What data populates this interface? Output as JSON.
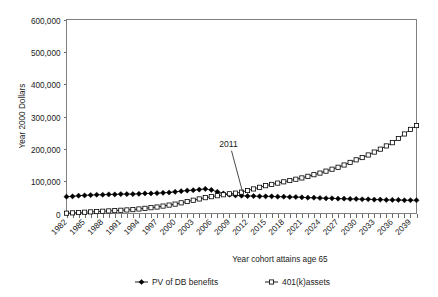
{
  "chart_data": {
    "type": "line",
    "title": "",
    "subtitle": "",
    "xlabel": "Year cohort attains age 65",
    "ylabel": "Year 2000 Dollars",
    "xlim": [
      1982,
      2040
    ],
    "ylim": [
      0,
      600000
    ],
    "ytick_labels": [
      "600,000",
      "500,000",
      "400,000",
      "300,000",
      "200,000",
      "100,000",
      "0"
    ],
    "ytick_values": [
      600000,
      500000,
      400000,
      300000,
      200000,
      100000,
      0
    ],
    "xtick_labels": [
      "1982",
      "1985",
      "1988",
      "1991",
      "1994",
      "1997",
      "2000",
      "2003",
      "2006",
      "2009",
      "2012",
      "2015",
      "2018",
      "2021",
      "2024",
      "2027",
      "2030",
      "2033",
      "2036",
      "2039"
    ],
    "xtick_values": [
      1982,
      1985,
      1988,
      1991,
      1994,
      1997,
      2000,
      2003,
      2006,
      2009,
      2012,
      2015,
      2018,
      2021,
      2024,
      2027,
      2030,
      2033,
      2036,
      2039
    ],
    "grid": false,
    "legend_position": "bottom",
    "x": [
      1982,
      1983,
      1984,
      1985,
      1986,
      1987,
      1988,
      1989,
      1990,
      1991,
      1992,
      1993,
      1994,
      1995,
      1996,
      1997,
      1998,
      1999,
      2000,
      2001,
      2002,
      2003,
      2004,
      2005,
      2006,
      2007,
      2008,
      2009,
      2010,
      2011,
      2012,
      2013,
      2014,
      2015,
      2016,
      2017,
      2018,
      2019,
      2020,
      2021,
      2022,
      2023,
      2024,
      2025,
      2026,
      2027,
      2028,
      2029,
      2030,
      2031,
      2032,
      2033,
      2034,
      2035,
      2036,
      2037,
      2038,
      2039,
      2040
    ],
    "series": [
      {
        "name": "PV of DB benefits",
        "marker": "filled-diamond",
        "values": [
          52000,
          53000,
          55000,
          56000,
          57000,
          58000,
          58000,
          59000,
          59000,
          60000,
          60000,
          60000,
          61000,
          62000,
          62000,
          63000,
          64000,
          65000,
          67000,
          69000,
          71000,
          72000,
          74000,
          76000,
          73000,
          67000,
          62000,
          58000,
          56000,
          55000,
          54000,
          54000,
          53000,
          53000,
          53000,
          52000,
          52000,
          51000,
          51000,
          50000,
          49000,
          49000,
          48000,
          47000,
          47000,
          46000,
          46000,
          45000,
          45000,
          44000,
          44000,
          43000,
          43000,
          42000,
          42000,
          42000,
          41000,
          41000,
          41000
        ]
      },
      {
        "name": "401(k)assets",
        "marker": "open-square",
        "values": [
          1000,
          2000,
          3000,
          4000,
          5000,
          6000,
          7000,
          8000,
          9000,
          10000,
          11000,
          12000,
          14000,
          16000,
          18000,
          20000,
          23000,
          26000,
          29000,
          33000,
          37000,
          41000,
          45000,
          49000,
          52000,
          55000,
          58000,
          61000,
          63000,
          66000,
          71000,
          76000,
          81000,
          86000,
          90000,
          94000,
          98000,
          102000,
          106000,
          110000,
          115000,
          120000,
          125000,
          131000,
          137000,
          143000,
          150000,
          158000,
          166000,
          173000,
          181000,
          190000,
          199000,
          209000,
          219000,
          232000,
          246000,
          260000,
          272000
        ]
      }
    ],
    "annotations": [
      {
        "text": "2011",
        "points_to_x": 2011,
        "points_to_y": 58000
      }
    ]
  },
  "legend": {
    "items": [
      {
        "label": "PV of DB benefits",
        "marker": "filled-diamond"
      },
      {
        "label": "401(k)assets",
        "marker": "open-square"
      }
    ]
  }
}
